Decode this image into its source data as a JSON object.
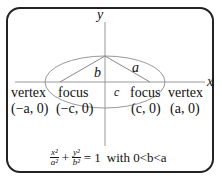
{
  "labels": {
    "x_axis": "x",
    "y_axis": "y",
    "b": "b",
    "a": "a",
    "c": "c",
    "vertex_left": "vertex",
    "vertex_left_coord": "(−a, 0)",
    "focus_left": "focus",
    "focus_left_coord": "(−c, 0)",
    "focus_right": "focus",
    "focus_right_coord": "(c, 0)",
    "vertex_right": "vertex",
    "vertex_right_coord": "(a, 0)"
  },
  "equation": {
    "x_num": "x²",
    "x_den": "a²",
    "plus": "+",
    "y_num": "y²",
    "y_den": "b²",
    "rhs": "= 1",
    "condition": "with 0<b<a"
  },
  "colors": {
    "axis": "#888888",
    "ellipse": "#888888",
    "border": "#222222"
  }
}
